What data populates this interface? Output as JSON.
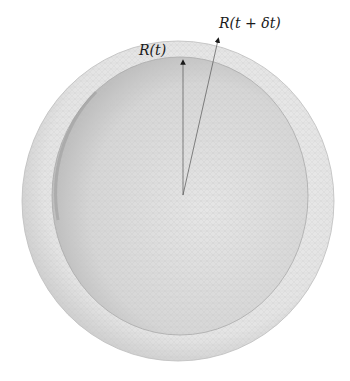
{
  "figure": {
    "labels": {
      "inner_radius": "R(t)",
      "outer_radius": "R(t + δt)"
    },
    "colors": {
      "background": "#ffffff",
      "outer_shell": "#e2e2e2",
      "inner_sphere": "#d0d0d0",
      "mesh": "#b8b8b8",
      "arrow": "#555555"
    },
    "geometry": {
      "center": [
        183,
        195
      ],
      "inner_tip": [
        183,
        58
      ],
      "outer_tip": [
        219,
        35
      ]
    }
  }
}
